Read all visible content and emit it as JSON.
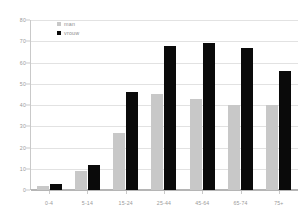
{
  "chart_data": {
    "type": "bar",
    "title": "",
    "subtitle": "",
    "xlabel": "",
    "ylabel": "",
    "ylim": [
      0,
      80
    ],
    "ytick_step": 10,
    "yticks": [
      "80",
      "70",
      "60",
      "50",
      "40",
      "30",
      "20",
      "10",
      "0"
    ],
    "grid": true,
    "legend_position": "top-left-inside",
    "categories": [
      "0-4",
      "5-14",
      "15-24",
      "25-44",
      "45-64",
      "65-74",
      "75+"
    ],
    "series": [
      {
        "name": "man",
        "color": "#c8c8c8",
        "values": [
          2,
          9,
          27,
          45,
          43,
          40,
          40
        ]
      },
      {
        "name": "vrouw",
        "color": "#0a0a0a",
        "values": [
          3,
          12,
          46,
          68,
          69,
          67,
          56
        ]
      }
    ]
  },
  "legend": {
    "items": [
      {
        "label": "man",
        "swatch": "legend-swatch-man"
      },
      {
        "label": "vrouw",
        "swatch": "legend-swatch-vrouw"
      }
    ]
  },
  "colors": {
    "man": "#c8c8c8",
    "vrouw": "#0a0a0a",
    "gridline": "#e2e2e2",
    "axis": "#b5b5b5",
    "tick_text": "#9a9a9a"
  }
}
